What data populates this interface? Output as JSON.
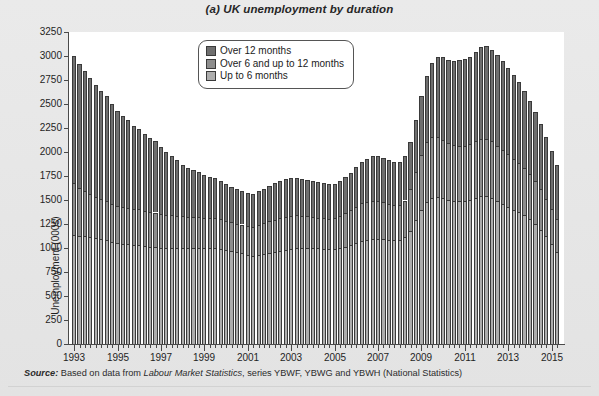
{
  "figure": {
    "label": "(a)",
    "title": "UK unemployment by duration",
    "source_word": "Source:",
    "source_pre": " Based on data from ",
    "source_publication": "Labour Market Statistics",
    "source_post": ", series YBWF, YBWG and YBWH (National Statistics)"
  },
  "legend": {
    "position": "inside-top-center",
    "items": [
      {
        "label": "Over 12 months",
        "color": "#6f6f6f"
      },
      {
        "label": "Over 6 and up to 12 months",
        "color": "#8d8d8d"
      },
      {
        "label": "Up to 6 months",
        "color": "#adadad"
      }
    ]
  },
  "chart_data": {
    "type": "bar",
    "subtype": "stacked-vertical",
    "title": "(a) UK unemployment by duration",
    "xlabel": "",
    "ylabel": "Unemployment (000s)",
    "ylim": [
      0,
      3250
    ],
    "ytick_step": 250,
    "yticks": [
      0,
      250,
      500,
      750,
      1000,
      1250,
      1500,
      1750,
      2000,
      2250,
      2500,
      2750,
      3000,
      3250
    ],
    "grid": false,
    "frequency": "quarterly",
    "x_range": [
      "1993 Q1",
      "2015 Q2"
    ],
    "xticks_major": [
      1993,
      1995,
      1997,
      1999,
      2001,
      2003,
      2005,
      2007,
      2009,
      2011,
      2013,
      2015
    ],
    "xtick_labels": [
      "1993",
      "1995",
      "1997",
      "1999",
      "2001",
      "2003",
      "2005",
      "2007",
      "2009",
      "2011",
      "2013",
      "2015"
    ],
    "categories": [
      "1993 Q1",
      "1993 Q2",
      "1993 Q3",
      "1993 Q4",
      "1994 Q1",
      "1994 Q2",
      "1994 Q3",
      "1994 Q4",
      "1995 Q1",
      "1995 Q2",
      "1995 Q3",
      "1995 Q4",
      "1996 Q1",
      "1996 Q2",
      "1996 Q3",
      "1996 Q4",
      "1997 Q1",
      "1997 Q2",
      "1997 Q3",
      "1997 Q4",
      "1998 Q1",
      "1998 Q2",
      "1998 Q3",
      "1998 Q4",
      "1999 Q1",
      "1999 Q2",
      "1999 Q3",
      "1999 Q4",
      "2000 Q1",
      "2000 Q2",
      "2000 Q3",
      "2000 Q4",
      "2001 Q1",
      "2001 Q2",
      "2001 Q3",
      "2001 Q4",
      "2002 Q1",
      "2002 Q2",
      "2002 Q3",
      "2002 Q4",
      "2003 Q1",
      "2003 Q2",
      "2003 Q3",
      "2003 Q4",
      "2004 Q1",
      "2004 Q2",
      "2004 Q3",
      "2004 Q4",
      "2005 Q1",
      "2005 Q2",
      "2005 Q3",
      "2005 Q4",
      "2006 Q1",
      "2006 Q2",
      "2006 Q3",
      "2006 Q4",
      "2007 Q1",
      "2007 Q2",
      "2007 Q3",
      "2007 Q4",
      "2008 Q1",
      "2008 Q2",
      "2008 Q3",
      "2008 Q4",
      "2009 Q1",
      "2009 Q2",
      "2009 Q3",
      "2009 Q4",
      "2010 Q1",
      "2010 Q2",
      "2010 Q3",
      "2010 Q4",
      "2011 Q1",
      "2011 Q2",
      "2011 Q3",
      "2011 Q4",
      "2012 Q1",
      "2012 Q2",
      "2012 Q3",
      "2012 Q4",
      "2013 Q1",
      "2013 Q2",
      "2013 Q3",
      "2013 Q4",
      "2014 Q1",
      "2014 Q2",
      "2014 Q3",
      "2014 Q4",
      "2015 Q1",
      "2015 Q2"
    ],
    "series": [
      {
        "name": "Up to 6 months",
        "color": "#adadad",
        "values": [
          1140,
          1130,
          1120,
          1110,
          1100,
          1090,
          1080,
          1060,
          1050,
          1040,
          1040,
          1030,
          1030,
          1020,
          1010,
          1010,
          1000,
          1000,
          1000,
          1000,
          1000,
          1000,
          1000,
          1000,
          1000,
          1000,
          1000,
          990,
          980,
          970,
          960,
          950,
          930,
          920,
          930,
          940,
          950,
          960,
          970,
          980,
          990,
          1000,
          1000,
          1000,
          1000,
          995,
          990,
          985,
          985,
          995,
          1010,
          1030,
          1050,
          1070,
          1080,
          1090,
          1095,
          1090,
          1085,
          1080,
          1080,
          1110,
          1180,
          1290,
          1400,
          1480,
          1520,
          1530,
          1520,
          1500,
          1490,
          1490,
          1490,
          1500,
          1520,
          1540,
          1540,
          1520,
          1490,
          1460,
          1430,
          1400,
          1370,
          1340,
          1300,
          1250,
          1190,
          1120,
          1040,
          960
        ]
      },
      {
        "name": "Over 6 and up to 12 months",
        "color": "#8d8d8d",
        "values": [
          540,
          500,
          470,
          450,
          430,
          420,
          410,
          400,
          390,
          385,
          380,
          375,
          375,
          370,
          365,
          360,
          350,
          345,
          340,
          335,
          330,
          325,
          320,
          320,
          315,
          315,
          315,
          310,
          305,
          300,
          295,
          295,
          295,
          300,
          310,
          320,
          330,
          335,
          340,
          345,
          345,
          340,
          335,
          330,
          325,
          320,
          320,
          320,
          325,
          335,
          350,
          365,
          380,
          395,
          400,
          400,
          395,
          385,
          375,
          370,
          370,
          385,
          430,
          500,
          570,
          620,
          640,
          630,
          610,
          590,
          580,
          575,
          575,
          580,
          590,
          600,
          600,
          590,
          575,
          560,
          545,
          530,
          515,
          495,
          470,
          445,
          420,
          395,
          370,
          345
        ]
      },
      {
        "name": "Over 12 months",
        "color": "#6f6f6f",
        "values": [
          1320,
          1290,
          1250,
          1210,
          1170,
          1130,
          1090,
          1040,
          990,
          950,
          910,
          870,
          830,
          800,
          770,
          740,
          700,
          660,
          620,
          580,
          540,
          510,
          490,
          470,
          450,
          430,
          415,
          400,
          385,
          370,
          360,
          350,
          345,
          345,
          350,
          360,
          370,
          380,
          390,
          395,
          395,
          390,
          385,
          380,
          375,
          370,
          365,
          360,
          360,
          365,
          375,
          390,
          410,
          430,
          450,
          465,
          470,
          465,
          455,
          450,
          450,
          460,
          490,
          540,
          610,
          690,
          770,
          830,
          860,
          870,
          880,
          890,
          900,
          915,
          930,
          950,
          960,
          955,
          945,
          930,
          905,
          875,
          840,
          800,
          760,
          720,
          680,
          640,
          600,
          560
        ]
      }
    ]
  }
}
